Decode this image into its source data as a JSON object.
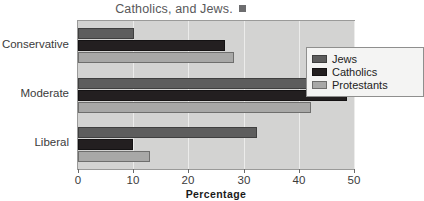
{
  "caption": {
    "text": "Catholics, and Jews.",
    "marker_icon": "filled-square-marker"
  },
  "chart_data": {
    "type": "bar",
    "orientation": "horizontal",
    "title": "Catholics, and Jews.",
    "xlabel": "Percentage",
    "ylabel": "",
    "xlim": [
      0,
      50
    ],
    "xticks": [
      0,
      10,
      20,
      30,
      40,
      50
    ],
    "xtick_labels": [
      "0",
      "10",
      "20",
      "30",
      "40",
      "50"
    ],
    "grid": true,
    "grid_axis": "x",
    "legend_position": "upper right",
    "categories": [
      "Conservative",
      "Moderate",
      "Liberal"
    ],
    "series": [
      {
        "name": "Jews",
        "color": "#5d5d5d",
        "values": [
          10.2,
          50.0,
          32.5
        ]
      },
      {
        "name": "Catholics",
        "color": "#231f20",
        "values": [
          26.7,
          48.7,
          10.0
        ]
      },
      {
        "name": "Protestants",
        "color": "#a8a8a7",
        "values": [
          28.2,
          42.2,
          13.0
        ]
      }
    ]
  },
  "legend": {
    "entries": [
      {
        "label": "Jews"
      },
      {
        "label": "Catholics"
      },
      {
        "label": "Protestants"
      }
    ]
  },
  "colors": {
    "plot_background": "#d3d3d2",
    "gridline": "#ececeb",
    "axis": "#6a6a6a",
    "legend_background": "#f4f4f3"
  }
}
